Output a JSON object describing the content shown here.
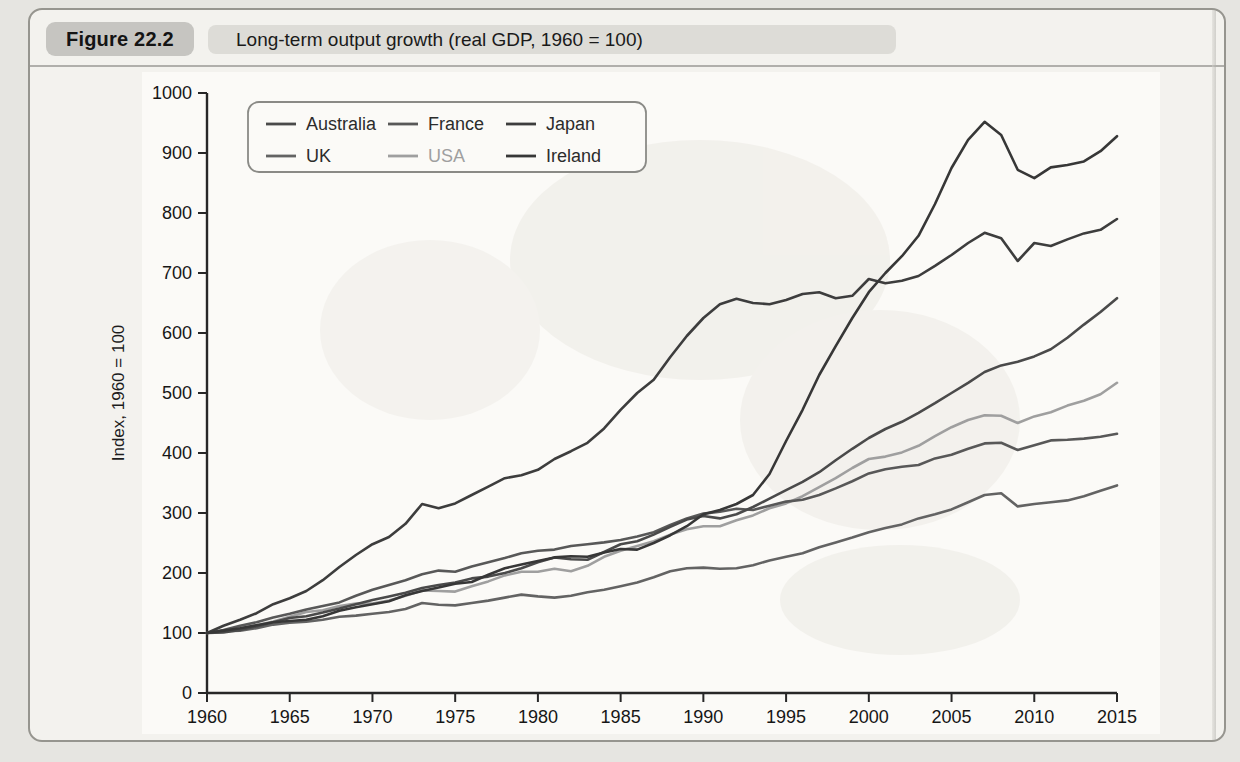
{
  "figure": {
    "badge_label": "Figure 22.2",
    "title": "Long-term output growth (real GDP, 1960 = 100)"
  },
  "chart_data": {
    "type": "line",
    "title": "Long-term output growth (real GDP, 1960 = 100)",
    "xlabel": "",
    "ylabel": "Index, 1960 = 100",
    "xlim": [
      1960,
      2015
    ],
    "ylim": [
      0,
      1000
    ],
    "x_start": 1960,
    "x_step": 1,
    "x_ticks": [
      1960,
      1965,
      1970,
      1975,
      1980,
      1985,
      1990,
      1995,
      2000,
      2005,
      2010,
      2015
    ],
    "y_ticks": [
      0,
      100,
      200,
      300,
      400,
      500,
      600,
      700,
      800,
      900,
      1000
    ],
    "grid": false,
    "legend": {
      "position": "top-left-inside",
      "rows": [
        [
          "Australia",
          "France",
          "Japan"
        ],
        [
          "UK",
          "USA",
          "Ireland"
        ]
      ]
    },
    "series": [
      {
        "name": "USA",
        "color": "#9f9f9f",
        "values": [
          100,
          102,
          108,
          113,
          119,
          127,
          135,
          138,
          145,
          149,
          149,
          154,
          162,
          171,
          170,
          169,
          178,
          186,
          196,
          202,
          202,
          207,
          203,
          212,
          227,
          237,
          245,
          253,
          264,
          273,
          278,
          278,
          288,
          296,
          308,
          316,
          328,
          343,
          358,
          375,
          390,
          394,
          401,
          412,
          428,
          443,
          455,
          463,
          462,
          450,
          461,
          468,
          479,
          487,
          498,
          517
        ]
      },
      {
        "name": "UK",
        "color": "#636363",
        "values": [
          100,
          103,
          104,
          108,
          114,
          117,
          119,
          122,
          127,
          129,
          132,
          135,
          140,
          150,
          147,
          146,
          150,
          154,
          159,
          164,
          161,
          159,
          162,
          168,
          172,
          178,
          184,
          193,
          203,
          208,
          209,
          207,
          208,
          213,
          221,
          227,
          233,
          243,
          251,
          259,
          268,
          275,
          281,
          291,
          298,
          306,
          318,
          330,
          333,
          311,
          315,
          318,
          321,
          328,
          337,
          346
        ]
      },
      {
        "name": "France",
        "color": "#585858",
        "values": [
          100,
          105,
          112,
          118,
          126,
          132,
          139,
          145,
          151,
          162,
          172,
          180,
          188,
          198,
          204,
          202,
          211,
          218,
          225,
          233,
          237,
          239,
          245,
          248,
          251,
          255,
          261,
          268,
          280,
          291,
          299,
          302,
          307,
          305,
          312,
          319,
          322,
          330,
          341,
          353,
          366,
          373,
          377,
          380,
          391,
          397,
          407,
          416,
          417,
          405,
          413,
          421,
          422,
          424,
          427,
          432
        ]
      },
      {
        "name": "Australia",
        "color": "#4a4a4a",
        "values": [
          100,
          101,
          105,
          111,
          118,
          125,
          128,
          134,
          141,
          148,
          155,
          161,
          167,
          175,
          180,
          184,
          191,
          194,
          200,
          208,
          218,
          226,
          223,
          222,
          235,
          248,
          253,
          264,
          277,
          289,
          295,
          291,
          298,
          310,
          324,
          338,
          352,
          368,
          388,
          407,
          425,
          440,
          452,
          467,
          483,
          500,
          517,
          535,
          546,
          552,
          561,
          573,
          592,
          614,
          635,
          658
        ]
      },
      {
        "name": "Japan",
        "color": "#3d3d3d",
        "values": [
          100,
          112,
          122,
          133,
          148,
          158,
          170,
          188,
          210,
          230,
          248,
          260,
          282,
          315,
          308,
          316,
          330,
          344,
          358,
          363,
          372,
          390,
          403,
          417,
          441,
          472,
          500,
          522,
          560,
          595,
          625,
          648,
          657,
          650,
          648,
          655,
          665,
          668,
          658,
          662,
          690,
          683,
          687,
          695,
          712,
          730,
          750,
          767,
          758,
          720,
          750,
          745,
          756,
          766,
          772,
          790
        ]
      },
      {
        "name": "Ireland",
        "color": "#373737",
        "values": [
          100,
          104,
          108,
          113,
          118,
          120,
          122,
          128,
          137,
          143,
          148,
          153,
          163,
          170,
          176,
          182,
          185,
          197,
          208,
          214,
          220,
          226,
          228,
          227,
          234,
          240,
          239,
          250,
          263,
          278,
          298,
          305,
          315,
          330,
          365,
          420,
          472,
          530,
          578,
          625,
          668,
          700,
          728,
          762,
          815,
          875,
          922,
          952,
          930,
          872,
          858,
          876,
          880,
          886,
          903,
          928
        ]
      }
    ]
  }
}
